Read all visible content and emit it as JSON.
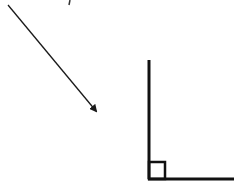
{
  "diagram": {
    "colors": {
      "stroke": "#1a1a1a",
      "background": "#ffffff"
    },
    "arrow": {
      "x1": 8,
      "y1": 5,
      "x2": 96,
      "y2": 111
    },
    "vertical_line": {
      "x": 149,
      "y1": 60,
      "y2": 179
    },
    "horizontal_line": {
      "y": 179,
      "x1": 149,
      "x2": 234
    },
    "right_angle_marker": {
      "x": 149,
      "y": 163,
      "size": 16
    },
    "top_mark": {
      "x": 70,
      "y": 0
    }
  }
}
